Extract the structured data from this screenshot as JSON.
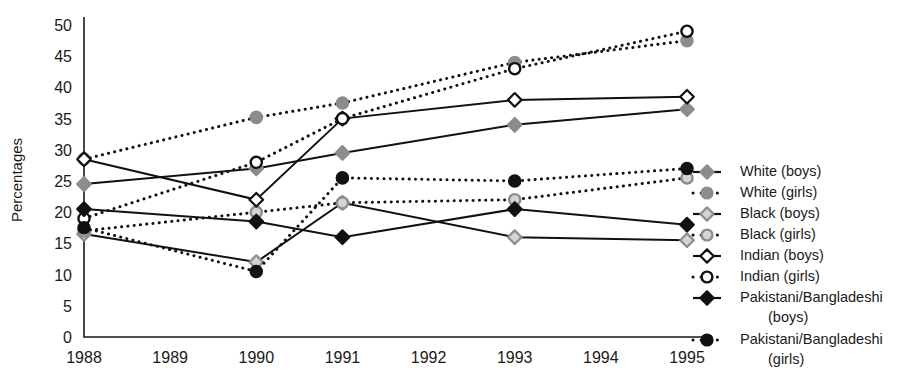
{
  "chart_data": {
    "type": "line",
    "title": "",
    "xlabel": "",
    "ylabel": "Percentages",
    "x": [
      1988,
      1989,
      1990,
      1991,
      1992,
      1993,
      1994,
      1995
    ],
    "xtick_labels": [
      "1988",
      "1989",
      "1990",
      "1991",
      "1992",
      "1993",
      "1994",
      "1995"
    ],
    "xlim": [
      1988,
      1995
    ],
    "ylim": [
      0,
      50
    ],
    "ytick_labels": [
      "0",
      "5",
      "10",
      "15",
      "20",
      "25",
      "30",
      "35",
      "40",
      "45",
      "50"
    ],
    "yticks": [
      0,
      5,
      10,
      15,
      20,
      25,
      30,
      35,
      40,
      45,
      50
    ],
    "grid": false,
    "legend_position": "right",
    "data_years": [
      1988,
      1990,
      1991,
      1993,
      1995
    ],
    "series": [
      {
        "name": "White  (boys)",
        "label_group": "White",
        "label_sex": "(boys)",
        "marker": "diamond",
        "marker_fill": "#8c8c8c",
        "marker_stroke": "#8c8c8c",
        "line_style": "solid",
        "line_color": "#111111",
        "x": [
          1988,
          1990,
          1991,
          1993,
          1995
        ],
        "values": [
          24.5,
          27.0,
          29.5,
          34.0,
          36.5
        ]
      },
      {
        "name": "White  (girls)",
        "label_group": "White",
        "label_sex": "(girls)",
        "marker": "circle",
        "marker_fill": "#8c8c8c",
        "marker_stroke": "#8c8c8c",
        "line_style": "dotted",
        "line_color": "#111111",
        "x": [
          1988,
          1990,
          1991,
          1993,
          1995
        ],
        "values": [
          28.5,
          35.2,
          37.5,
          44.0,
          47.5
        ]
      },
      {
        "name": "Black  (boys)",
        "label_group": "Black",
        "label_sex": "(boys)",
        "marker": "diamond",
        "marker_fill": "#d4d4d4",
        "marker_stroke": "#8c8c8c",
        "line_style": "solid",
        "line_color": "#111111",
        "x": [
          1988,
          1990,
          1991,
          1993,
          1995
        ],
        "values": [
          16.5,
          12.0,
          21.5,
          16.0,
          15.5
        ]
      },
      {
        "name": "Black  (girls)",
        "label_group": "Black",
        "label_sex": "(girls)",
        "marker": "circle",
        "marker_fill": "#d4d4d4",
        "marker_stroke": "#8c8c8c",
        "line_style": "dotted",
        "line_color": "#111111",
        "x": [
          1988,
          1990,
          1991,
          1993,
          1995
        ],
        "values": [
          17.0,
          20.0,
          21.5,
          22.0,
          25.5
        ]
      },
      {
        "name": "Indian  (boys)",
        "label_group": "Indian",
        "label_sex": "(boys)",
        "marker": "diamond",
        "marker_fill": "#ffffff",
        "marker_stroke": "#111111",
        "line_style": "solid",
        "line_color": "#111111",
        "x": [
          1988,
          1990,
          1991,
          1993,
          1995
        ],
        "values": [
          28.5,
          22.0,
          35.0,
          38.0,
          38.5
        ]
      },
      {
        "name": "Indian  (girls)",
        "label_group": "Indian",
        "label_sex": "(girls)",
        "marker": "circle",
        "marker_fill": "#ffffff",
        "marker_stroke": "#111111",
        "line_style": "dotted",
        "line_color": "#111111",
        "x": [
          1988,
          1990,
          1991,
          1993,
          1995
        ],
        "values": [
          19.0,
          28.0,
          35.0,
          43.0,
          49.0
        ]
      },
      {
        "name": "Pakistani/Bangladeshi (boys)",
        "label_group": "Pakistani/Bangladeshi",
        "label_sex": "(boys)",
        "marker": "diamond",
        "marker_fill": "#111111",
        "marker_stroke": "#111111",
        "line_style": "solid",
        "line_color": "#111111",
        "x": [
          1988,
          1990,
          1991,
          1993,
          1995
        ],
        "values": [
          20.5,
          18.5,
          16.0,
          20.5,
          18.0
        ]
      },
      {
        "name": "Pakistani/Bangladeshi (girls)",
        "label_group": "Pakistani/Bangladeshi",
        "label_sex": "(girls)",
        "marker": "circle",
        "marker_fill": "#111111",
        "marker_stroke": "#111111",
        "line_style": "dotted",
        "line_color": "#111111",
        "x": [
          1988,
          1990,
          1991,
          1993,
          1995
        ],
        "values": [
          17.5,
          10.5,
          25.5,
          25.0,
          27.0
        ]
      }
    ]
  },
  "legend": {
    "entries": [
      {
        "label": "White  (boys)",
        "line2": ""
      },
      {
        "label": "White  (girls)",
        "line2": ""
      },
      {
        "label": "Black  (boys)",
        "line2": ""
      },
      {
        "label": "Black  (girls)",
        "line2": ""
      },
      {
        "label": "Indian  (boys)",
        "line2": ""
      },
      {
        "label": "Indian  (girls)",
        "line2": ""
      },
      {
        "label": "Pakistani/Bangladeshi",
        "line2": "(boys)"
      },
      {
        "label": "Pakistani/Bangladeshi",
        "line2": "(girls)"
      }
    ]
  },
  "colors": {
    "axis": "#1a1a1a",
    "line": "#111111",
    "grey_marker": "#8c8c8c",
    "light_marker": "#d4d4d4",
    "black_marker": "#111111",
    "background": "#ffffff"
  }
}
